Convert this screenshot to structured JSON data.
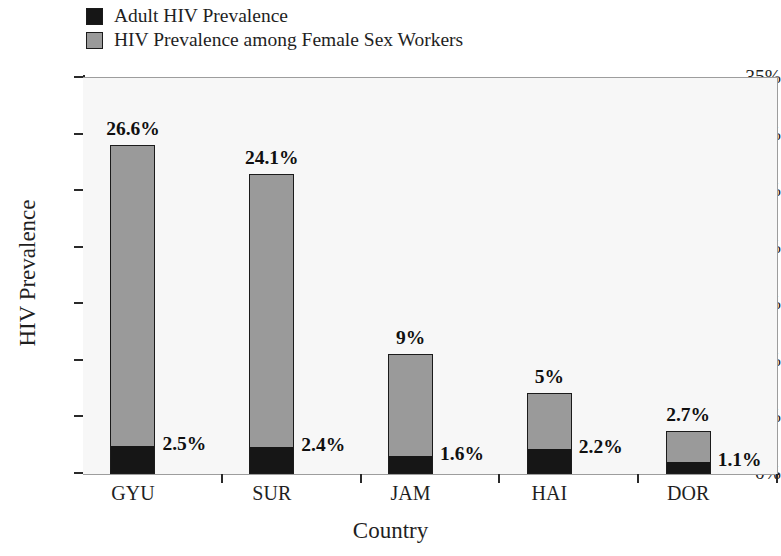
{
  "legend": {
    "items": [
      {
        "label": "Adult HIV Prevalence",
        "color": "#161616",
        "swatch_name": "legend-swatch-adult"
      },
      {
        "label": "HIV Prevalence among Female Sex Workers",
        "color": "#9a9a9a",
        "swatch_name": "legend-swatch-fsw"
      }
    ]
  },
  "axes": {
    "y_title": "HIV Prevalence",
    "x_title": "Country",
    "y_ticks": [
      "0%",
      "5%",
      "10%",
      "15%",
      "20%",
      "25%",
      "30%",
      "35%"
    ]
  },
  "chart_data": {
    "type": "bar",
    "subtype": "stacked-bar",
    "title": "",
    "xlabel": "Country",
    "ylabel": "HIV Prevalence",
    "ylim": [
      0,
      35
    ],
    "ytick_values": [
      0,
      5,
      10,
      15,
      20,
      25,
      30,
      35
    ],
    "ytick_labels": [
      "0%",
      "5%",
      "10%",
      "15%",
      "20%",
      "25%",
      "30%",
      "35%"
    ],
    "grid": false,
    "legend_position": "top-left outside",
    "categories": [
      "GYU",
      "SUR",
      "JAM",
      "HAI",
      "DOR"
    ],
    "series": [
      {
        "name": "Adult HIV Prevalence",
        "color": "#161616",
        "values": [
          2.5,
          2.4,
          1.6,
          2.2,
          1.1
        ],
        "data_labels": [
          "2.5%",
          "2.4%",
          "1.6%",
          "2.2%",
          "1.1%"
        ],
        "label_position": "right of bar at segment top"
      },
      {
        "name": "HIV Prevalence among Female Sex Workers",
        "color": "#9a9a9a",
        "values": [
          26.6,
          24.1,
          9.0,
          5.0,
          2.7
        ],
        "data_labels": [
          "26.6%",
          "24.1%",
          "9%",
          "5%",
          "2.7%"
        ],
        "label_position": "above bar"
      }
    ],
    "stack_totals": [
      29.1,
      26.5,
      10.6,
      7.2,
      3.8
    ]
  },
  "bars": [
    {
      "category": "GYU",
      "adult_value": 2.5,
      "adult_label": "2.5%",
      "fsw_value": 26.6,
      "fsw_label": "26.6%"
    },
    {
      "category": "SUR",
      "adult_value": 2.4,
      "adult_label": "2.4%",
      "fsw_value": 24.1,
      "fsw_label": "24.1%"
    },
    {
      "category": "JAM",
      "adult_value": 1.6,
      "adult_label": "1.6%",
      "fsw_value": 9.0,
      "fsw_label": "9%"
    },
    {
      "category": "HAI",
      "adult_value": 2.2,
      "adult_label": "2.2%",
      "fsw_value": 5.0,
      "fsw_label": "5%"
    },
    {
      "category": "DOR",
      "adult_value": 1.1,
      "adult_label": "1.1%",
      "fsw_value": 2.7,
      "fsw_label": "2.7%"
    }
  ]
}
